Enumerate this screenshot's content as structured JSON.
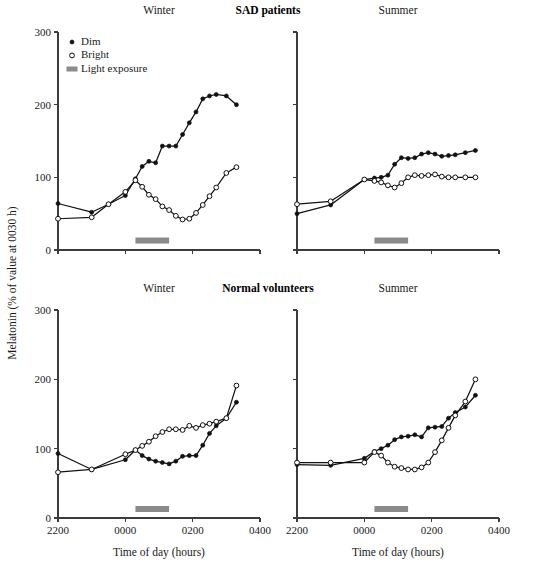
{
  "figure": {
    "group_titles": [
      {
        "text": "SAD patients",
        "x": 268,
        "y": 13
      },
      {
        "text": "Normal volunteers",
        "x": 268,
        "y": 291
      }
    ],
    "axis_titles": {
      "y": "Melatonin (% of value at 0030 h)",
      "x": "Time of day (hours)"
    },
    "legend": {
      "items": [
        {
          "label": "Dim",
          "marker": "filled-circle-icon"
        },
        {
          "label": "Bright",
          "marker": "open-circle-icon"
        },
        {
          "label": "Light exposure",
          "marker": "gray-bar-icon"
        }
      ]
    },
    "colors": {
      "line": "#111111",
      "light_bar": "#8a8a8a",
      "axis": "#3c3c3c",
      "background": "#ffffff"
    },
    "axes": {
      "y_ticks": [
        0,
        100,
        200,
        300
      ],
      "y_tick_labels": [
        "0",
        "100",
        "200",
        "300"
      ],
      "ylim": [
        0,
        300
      ],
      "x_ticks": [
        2200,
        2400,
        2600,
        2800
      ],
      "x_tick_labels": [
        "2200",
        "0000",
        "0200",
        "0400"
      ],
      "xlim": [
        2200,
        2800
      ]
    },
    "light_exposure": {
      "start": 2430,
      "end": 2530,
      "y": 13
    }
  },
  "chart_data": [
    {
      "id": "sad-winter",
      "type": "line",
      "title": "Winter",
      "group": "SAD patients",
      "panel": "top-left",
      "xlabel": "Time of day (hours)",
      "ylabel": "Melatonin (% of value at 0030 h)",
      "xlim": [
        2200,
        2800
      ],
      "ylim": [
        0,
        300
      ],
      "grid": false,
      "x_tick_labels": [
        "2200",
        "0000",
        "0200",
        "0400"
      ],
      "y_tick_labels": [
        "0",
        "100",
        "200",
        "300"
      ],
      "series": [
        {
          "name": "Dim",
          "marker": "filled-circle",
          "x": [
            2200,
            2300,
            2350,
            2400,
            2430,
            2450,
            2470,
            2490,
            2510,
            2530,
            2550,
            2570,
            2590,
            2610,
            2630,
            2650,
            2670,
            2700,
            2730
          ],
          "values": [
            64,
            52,
            63,
            75,
            98,
            115,
            122,
            120,
            143,
            143,
            143,
            159,
            175,
            190,
            208,
            212,
            214,
            212,
            200
          ]
        },
        {
          "name": "Bright",
          "marker": "open-circle",
          "x": [
            2200,
            2300,
            2350,
            2400,
            2430,
            2450,
            2470,
            2490,
            2510,
            2530,
            2550,
            2570,
            2590,
            2610,
            2630,
            2650,
            2670,
            2700,
            2730
          ],
          "values": [
            43,
            45,
            63,
            80,
            96,
            87,
            76,
            70,
            60,
            55,
            47,
            42,
            43,
            51,
            62,
            74,
            86,
            106,
            114
          ]
        }
      ]
    },
    {
      "id": "sad-summer",
      "type": "line",
      "title": "Summer",
      "group": "SAD patients",
      "panel": "top-right",
      "xlabel": "Time of day (hours)",
      "ylabel": "",
      "xlim": [
        2200,
        2800
      ],
      "ylim": [
        0,
        300
      ],
      "grid": false,
      "x_tick_labels": [
        "2200",
        "0000",
        "0200",
        "0400"
      ],
      "y_tick_labels": [
        "0",
        "100",
        "200",
        "300"
      ],
      "series": [
        {
          "name": "Dim",
          "marker": "filled-circle",
          "x": [
            2200,
            2300,
            2400,
            2430,
            2450,
            2470,
            2490,
            2510,
            2530,
            2550,
            2570,
            2590,
            2610,
            2630,
            2650,
            2670,
            2700,
            2730
          ],
          "values": [
            50,
            62,
            97,
            99,
            100,
            103,
            118,
            127,
            126,
            127,
            132,
            134,
            132,
            129,
            130,
            131,
            134,
            137
          ]
        },
        {
          "name": "Bright",
          "marker": "open-circle",
          "x": [
            2200,
            2300,
            2400,
            2430,
            2450,
            2470,
            2490,
            2510,
            2530,
            2550,
            2570,
            2590,
            2610,
            2630,
            2650,
            2670,
            2700,
            2730
          ],
          "values": [
            63,
            67,
            97,
            95,
            93,
            89,
            86,
            92,
            100,
            103,
            102,
            103,
            104,
            101,
            100,
            100,
            100,
            100
          ]
        }
      ]
    },
    {
      "id": "normal-winter",
      "type": "line",
      "title": "Winter",
      "group": "Normal volunteers",
      "panel": "bottom-left",
      "xlabel": "Time of day (hours)",
      "ylabel": "Melatonin (% of value at 0030 h)",
      "xlim": [
        2200,
        2800
      ],
      "ylim": [
        0,
        300
      ],
      "grid": false,
      "x_tick_labels": [
        "2200",
        "0000",
        "0200",
        "0400"
      ],
      "y_tick_labels": [
        "0",
        "100",
        "200",
        "300"
      ],
      "series": [
        {
          "name": "Dim",
          "marker": "filled-circle",
          "x": [
            2200,
            2300,
            2400,
            2430,
            2450,
            2470,
            2490,
            2510,
            2530,
            2550,
            2570,
            2590,
            2610,
            2630,
            2650,
            2670,
            2700,
            2730
          ],
          "values": [
            93,
            70,
            84,
            98,
            90,
            85,
            82,
            80,
            78,
            82,
            89,
            90,
            90,
            105,
            122,
            133,
            144,
            167
          ]
        },
        {
          "name": "Bright",
          "marker": "open-circle",
          "x": [
            2200,
            2300,
            2400,
            2430,
            2450,
            2470,
            2490,
            2510,
            2530,
            2550,
            2570,
            2590,
            2610,
            2630,
            2650,
            2670,
            2700,
            2730
          ],
          "values": [
            66,
            70,
            92,
            98,
            104,
            110,
            118,
            124,
            128,
            128,
            127,
            133,
            130,
            134,
            136,
            139,
            144,
            191
          ]
        }
      ]
    },
    {
      "id": "normal-summer",
      "type": "line",
      "title": "Summer",
      "group": "Normal volunteers",
      "panel": "bottom-right",
      "xlabel": "Time of day (hours)",
      "ylabel": "",
      "xlim": [
        2200,
        2800
      ],
      "ylim": [
        0,
        300
      ],
      "grid": false,
      "x_tick_labels": [
        "2200",
        "0000",
        "0200",
        "0400"
      ],
      "y_tick_labels": [
        "0",
        "100",
        "200",
        "300"
      ],
      "series": [
        {
          "name": "Dim",
          "marker": "filled-circle",
          "x": [
            2200,
            2300,
            2400,
            2430,
            2450,
            2470,
            2490,
            2510,
            2530,
            2550,
            2570,
            2590,
            2610,
            2630,
            2650,
            2670,
            2700,
            2730
          ],
          "values": [
            77,
            76,
            86,
            96,
            100,
            105,
            113,
            117,
            118,
            120,
            117,
            130,
            131,
            132,
            144,
            152,
            160,
            177
          ]
        },
        {
          "name": "Bright",
          "marker": "open-circle",
          "x": [
            2200,
            2300,
            2400,
            2430,
            2450,
            2470,
            2490,
            2510,
            2530,
            2550,
            2570,
            2590,
            2610,
            2630,
            2650,
            2670,
            2700,
            2730
          ],
          "values": [
            80,
            80,
            80,
            95,
            90,
            80,
            74,
            72,
            70,
            70,
            73,
            80,
            95,
            112,
            130,
            148,
            168,
            200
          ]
        }
      ]
    }
  ]
}
